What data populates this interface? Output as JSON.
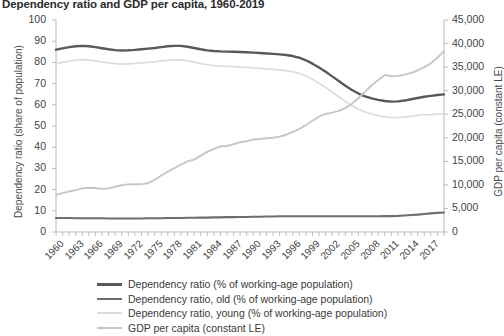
{
  "chart_data": {
    "type": "line",
    "title": "Dependency ratio and GDP per capita, 1960-2019",
    "xlabel": "",
    "ylabel": "Dependency ratio (share of population)",
    "y2label": "GDP per capita (constant LE)",
    "xlim": [
      1960,
      2019
    ],
    "ylim": [
      0,
      100
    ],
    "y2lim": [
      0,
      45000
    ],
    "grid": false,
    "legend_position": "bottom",
    "y_ticks": [
      "0",
      "10",
      "20",
      "30",
      "40",
      "50",
      "60",
      "70",
      "80",
      "90",
      "100"
    ],
    "y_tick_values": [
      0,
      10,
      20,
      30,
      40,
      50,
      60,
      70,
      80,
      90,
      100
    ],
    "y2_ticks": [
      "0",
      "5,000",
      "10,000",
      "15,000",
      "20,000",
      "25,000",
      "30,000",
      "35,000",
      "40,000",
      "45,000"
    ],
    "y2_tick_values": [
      0,
      5000,
      10000,
      15000,
      20000,
      25000,
      30000,
      35000,
      40000,
      45000
    ],
    "x_ticks": [
      "1960",
      "1963",
      "1966",
      "1969",
      "1972",
      "1975",
      "1978",
      "1981",
      "1984",
      "1987",
      "1990",
      "1993",
      "1996",
      "1999",
      "2002",
      "2005",
      "2008",
      "2011",
      "2014",
      "2017"
    ],
    "x_tick_values": [
      1960,
      1963,
      1966,
      1969,
      1972,
      1975,
      1978,
      1981,
      1984,
      1987,
      1990,
      1993,
      1996,
      1999,
      2002,
      2005,
      2008,
      2011,
      2014,
      2017
    ],
    "x": [
      1960,
      1961,
      1962,
      1963,
      1964,
      1965,
      1966,
      1967,
      1968,
      1969,
      1970,
      1971,
      1972,
      1973,
      1974,
      1975,
      1976,
      1977,
      1978,
      1979,
      1980,
      1981,
      1982,
      1983,
      1984,
      1985,
      1986,
      1987,
      1988,
      1989,
      1990,
      1991,
      1992,
      1993,
      1994,
      1995,
      1996,
      1997,
      1998,
      1999,
      2000,
      2001,
      2002,
      2003,
      2004,
      2005,
      2006,
      2007,
      2008,
      2009,
      2010,
      2011,
      2012,
      2013,
      2014,
      2015,
      2016,
      2017,
      2018,
      2019
    ],
    "series": [
      {
        "name": "Dependency ratio (% of working-age population)",
        "axis": "left",
        "color": "#595959",
        "width": 2.4,
        "values": [
          86.0,
          86.6,
          87.2,
          87.6,
          87.8,
          87.6,
          87.2,
          86.7,
          86.2,
          85.8,
          85.6,
          85.7,
          85.9,
          86.2,
          86.5,
          86.8,
          87.2,
          87.6,
          87.8,
          87.8,
          87.4,
          86.8,
          86.2,
          85.7,
          85.4,
          85.2,
          85.1,
          85.0,
          84.9,
          84.8,
          84.6,
          84.4,
          84.2,
          84.0,
          83.8,
          83.5,
          83.0,
          82.2,
          81.0,
          79.4,
          77.6,
          75.6,
          73.4,
          71.2,
          69.0,
          67.0,
          65.3,
          64.0,
          63.0,
          62.3,
          61.8,
          61.5,
          61.6,
          62.0,
          62.6,
          63.2,
          63.8,
          64.2,
          64.6,
          64.9
        ]
      },
      {
        "name": "Dependency ratio, old (% of working-age population)",
        "axis": "left",
        "color": "#6e6e6e",
        "width": 2.1,
        "values": [
          6.6,
          6.6,
          6.6,
          6.5,
          6.5,
          6.5,
          6.5,
          6.5,
          6.4,
          6.4,
          6.4,
          6.4,
          6.4,
          6.4,
          6.5,
          6.5,
          6.5,
          6.6,
          6.6,
          6.6,
          6.7,
          6.7,
          6.8,
          6.8,
          6.9,
          6.9,
          7.0,
          7.0,
          7.1,
          7.1,
          7.2,
          7.2,
          7.3,
          7.3,
          7.4,
          7.4,
          7.4,
          7.4,
          7.4,
          7.4,
          7.4,
          7.4,
          7.4,
          7.4,
          7.4,
          7.4,
          7.4,
          7.4,
          7.4,
          7.4,
          7.5,
          7.5,
          7.6,
          7.8,
          8.0,
          8.2,
          8.5,
          8.8,
          9.0,
          9.2
        ]
      },
      {
        "name": "Dependency ratio, young (% of working-age population)",
        "axis": "left",
        "color": "#dcdcdc",
        "width": 1.7,
        "values": [
          79.4,
          80.0,
          80.6,
          81.1,
          81.3,
          81.1,
          80.7,
          80.2,
          79.8,
          79.4,
          79.2,
          79.3,
          79.5,
          79.8,
          80.0,
          80.3,
          80.7,
          81.0,
          81.2,
          81.2,
          80.7,
          80.1,
          79.4,
          78.9,
          78.5,
          78.3,
          78.1,
          78.0,
          77.8,
          77.7,
          77.4,
          77.2,
          76.9,
          76.7,
          76.4,
          76.1,
          75.6,
          74.8,
          73.6,
          72.0,
          70.2,
          68.2,
          66.0,
          63.8,
          61.6,
          59.6,
          57.9,
          56.6,
          55.6,
          54.9,
          54.3,
          54.0,
          54.0,
          54.2,
          54.6,
          55.0,
          55.3,
          55.4,
          55.6,
          55.7
        ]
      },
      {
        "name": "GDP per capita (constant LE)",
        "axis": "right",
        "color": "#c6c6c6",
        "width": 1.9,
        "values": [
          7900,
          8250,
          8600,
          8900,
          9250,
          9400,
          9350,
          9150,
          9250,
          9600,
          9950,
          10100,
          10150,
          10150,
          10350,
          11050,
          12000,
          12800,
          13550,
          14300,
          15000,
          15350,
          16200,
          17000,
          17650,
          18200,
          18250,
          18650,
          19050,
          19300,
          19650,
          19750,
          19900,
          20000,
          20250,
          20650,
          21250,
          21900,
          22700,
          23600,
          24500,
          25050,
          25350,
          25700,
          26300,
          27200,
          28450,
          29800,
          31150,
          32250,
          33350,
          33050,
          33150,
          33400,
          33750,
          34300,
          35000,
          35800,
          37000,
          38400
        ]
      }
    ]
  },
  "legend": {
    "items": [
      {
        "label": "Dependency ratio (% of working-age population)"
      },
      {
        "label": "Dependency ratio, old (% of working-age population)"
      },
      {
        "label": "Dependency ratio, young (% of working-age population)"
      },
      {
        "label": "GDP per capita (constant LE)"
      }
    ]
  }
}
